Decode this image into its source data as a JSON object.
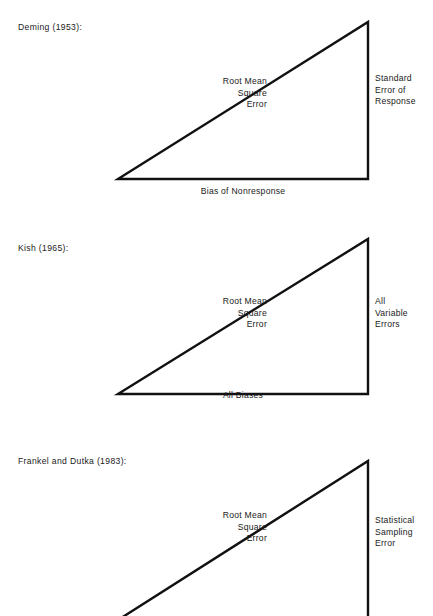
{
  "document": {
    "background_color": "#ffffff",
    "ink_color": "#111111",
    "page_width": 433,
    "page_height": 616
  },
  "figures": [
    {
      "id": "deming",
      "title": "Deming  (1953):",
      "hypotenuse_label": [
        "Root Mean",
        "Square",
        "Error"
      ],
      "vertical_label": [
        "Standard",
        "Error of",
        "Response"
      ],
      "base_label": "Bias of Nonresponse",
      "triangle": {
        "apex_x": 368,
        "apex_y": 22,
        "base_left_x": 118,
        "base_y": 179,
        "stroke_width": 2.4
      }
    },
    {
      "id": "kish",
      "title": "Kish  (1965):",
      "hypotenuse_label": [
        "Root Mean",
        "Square",
        "Error"
      ],
      "vertical_label": [
        "All",
        "Variable",
        "Errors"
      ],
      "base_label": "All Biases",
      "triangle": {
        "apex_x": 368,
        "apex_y": 29,
        "base_left_x": 118,
        "base_y": 184,
        "stroke_width": 2.4
      }
    },
    {
      "id": "frankel-dutka",
      "title": "Frankel and Dutka  (1983):",
      "hypotenuse_label": [
        "Root Mean",
        "Square",
        "Error"
      ],
      "vertical_label": [
        "Statistical",
        "Sampling",
        "Error"
      ],
      "base_label": "",
      "triangle": {
        "apex_x": 368,
        "apex_y": 41,
        "base_left_x": 118,
        "base_y": 200,
        "stroke_width": 2.4,
        "clipped_at_page_bottom": true
      }
    }
  ]
}
